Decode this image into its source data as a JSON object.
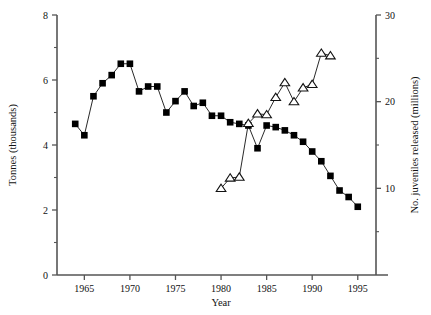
{
  "chart_data": {
    "type": "line",
    "title": "",
    "xlabel": "Year",
    "ylabel": "Tonnes (thousands)",
    "y2label": "No. juveniles released (millions)",
    "xlim": [
      1962,
      1997
    ],
    "ylim": [
      0,
      8
    ],
    "y2lim": [
      0,
      30
    ],
    "xticks": [
      1965,
      1970,
      1975,
      1980,
      1985,
      1990,
      1995
    ],
    "xticklabels": [
      "1965",
      "1970",
      "1975",
      "1980",
      "1985",
      "1990",
      "1995"
    ],
    "yticks": [
      0,
      2,
      4,
      6,
      8
    ],
    "yticklabels": [
      "0",
      "2",
      "4",
      "6",
      "8"
    ],
    "yticks_minor": [
      1,
      3,
      5,
      7
    ],
    "y2ticks": [
      10,
      20,
      30
    ],
    "y2ticklabels": [
      "10",
      "20",
      "30"
    ],
    "y2ticks_minor": [
      5,
      15,
      25
    ],
    "grid": false,
    "legend": "none",
    "series": [
      {
        "name": "Tonnes (thousands)",
        "axis": "left",
        "marker": "filled-square",
        "x": [
          1964,
          1965,
          1966,
          1967,
          1968,
          1969,
          1970,
          1971,
          1972,
          1973,
          1974,
          1975,
          1976,
          1977,
          1978,
          1979,
          1980,
          1981,
          1982,
          1983,
          1984,
          1985,
          1986,
          1987,
          1988,
          1989,
          1990,
          1991,
          1992,
          1993,
          1994,
          1995
        ],
        "values": [
          4.65,
          4.3,
          5.5,
          5.9,
          6.15,
          6.5,
          6.5,
          5.65,
          5.8,
          5.8,
          5.0,
          5.35,
          5.65,
          5.2,
          5.3,
          4.9,
          4.9,
          4.7,
          4.65,
          4.6,
          3.9,
          4.6,
          4.55,
          4.45,
          4.3,
          4.1,
          3.8,
          3.5,
          3.05,
          2.6,
          2.4,
          2.1
        ]
      },
      {
        "name": "No. juveniles released (millions)",
        "axis": "right",
        "marker": "open-triangle",
        "x": [
          1980,
          1981,
          1982,
          1983,
          1984,
          1985,
          1986,
          1987,
          1988,
          1989,
          1990,
          1991,
          1992
        ],
        "values": [
          10.0,
          11.2,
          11.3,
          17.5,
          18.6,
          18.5,
          20.5,
          22.2,
          20.0,
          21.6,
          22.0,
          25.6,
          25.3
        ]
      }
    ]
  },
  "axes": {
    "x_label": "Year",
    "y_left_label": "Tonnes (thousands)",
    "y_right_label": "No. juveniles released (millions)"
  }
}
